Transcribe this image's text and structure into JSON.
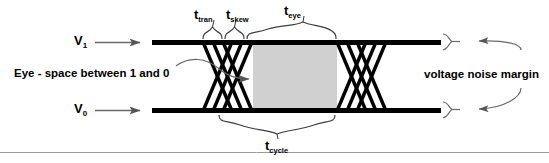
{
  "figure": {
    "background_color": "#ffffff",
    "line_color": "#000000",
    "eye_fill_color": "#d0d0d0",
    "annotation_color": "#3f3f3f",
    "arrow_fill_color": "#555555"
  },
  "signals": {
    "high_label_base": "V",
    "high_label_sub": "1",
    "low_label_base": "V",
    "low_label_sub": "0"
  },
  "timing": {
    "t_base": "t",
    "tran_sub": "tran",
    "skew_sub": "skew",
    "eye_sub": "eye",
    "cycle_sub": "cycle"
  },
  "annotations": {
    "eye_caption": "Eye - space between 1 and 0",
    "noise_margin_caption": "voltage noise margin"
  }
}
